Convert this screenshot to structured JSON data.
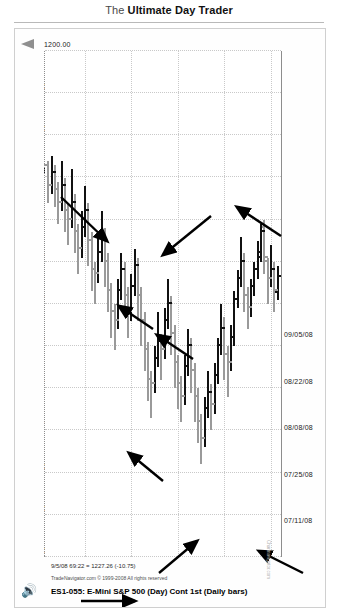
{
  "page": {
    "header_prefix": "The ",
    "header_bold": "Ultimate Day Trader"
  },
  "figure": {
    "chart_title": "ES1-055: E-Mini S&P 500 (Day) Cont 1st (Daily bars)",
    "copyright": "TradeNavigator.com © 1999-2008 All rights reserved",
    "quote_line": "9/5/08 69:22 = 1227.26 (-10.75)",
    "watermark_icon": "speaker-icon",
    "watermark_text": "Chartnavigator.com",
    "axis_arrow_icon": "up-arrow-icon",
    "highlight_color": "#1b1b1b",
    "bar_up_color": "#111111",
    "bar_down_color": "#9a9a9a"
  },
  "chart_data": {
    "type": "bar",
    "subtype": "ohlc-daily-bars-rotated",
    "title": "ES1-055: E-Mini S&P 500 (Day) Cont 1st (Daily bars)",
    "xlabel": "",
    "ylabel": "",
    "grid": true,
    "legend_position": "none",
    "ylim": [
      1200,
      1320
    ],
    "price_ticks": [
      "1320.00",
      "1310.00",
      "1300.00",
      "1290.00",
      "1280.00",
      "1270.00",
      "1260.00",
      "1250.00",
      "1240.00",
      "1230.00",
      "1220.00",
      "1210.00",
      "1200.00"
    ],
    "price_tick_highlighted": "1230.00",
    "date_ticks": [
      "09/05/08",
      "08/22/08",
      "08/08/08",
      "07/25/08",
      "07/11/08"
    ],
    "last_quote": {
      "date": "9/5/08",
      "price": 1227.26,
      "change": -10.75
    },
    "bars": [
      {
        "i": 0,
        "o": 1253.5,
        "h": 1259.0,
        "l": 1251.0,
        "c": 1257.5,
        "dir": "up"
      },
      {
        "i": 1,
        "o": 1257.0,
        "h": 1262.0,
        "l": 1250.0,
        "c": 1252.0,
        "dir": "down"
      },
      {
        "i": 2,
        "o": 1252.0,
        "h": 1256.0,
        "l": 1246.0,
        "c": 1254.0,
        "dir": "up"
      },
      {
        "i": 3,
        "o": 1254.0,
        "h": 1260.0,
        "l": 1249.0,
        "c": 1250.0,
        "dir": "down"
      },
      {
        "i": 4,
        "o": 1249.0,
        "h": 1253.0,
        "l": 1240.0,
        "c": 1242.0,
        "dir": "down"
      },
      {
        "i": 5,
        "o": 1243.0,
        "h": 1250.0,
        "l": 1241.0,
        "c": 1249.0,
        "dir": "up"
      },
      {
        "i": 6,
        "o": 1248.0,
        "h": 1254.0,
        "l": 1245.0,
        "c": 1252.0,
        "dir": "up"
      },
      {
        "i": 7,
        "o": 1252.0,
        "h": 1258.0,
        "l": 1250.0,
        "c": 1256.0,
        "dir": "up"
      },
      {
        "i": 8,
        "o": 1256.0,
        "h": 1263.0,
        "l": 1254.0,
        "c": 1261.0,
        "dir": "up"
      },
      {
        "i": 9,
        "o": 1261.0,
        "h": 1266.0,
        "l": 1256.0,
        "c": 1258.0,
        "dir": "down"
      },
      {
        "i": 10,
        "o": 1258.0,
        "h": 1262.0,
        "l": 1248.0,
        "c": 1250.0,
        "dir": "down"
      },
      {
        "i": 11,
        "o": 1250.0,
        "h": 1256.0,
        "l": 1244.0,
        "c": 1254.0,
        "dir": "up"
      },
      {
        "i": 12,
        "o": 1254.0,
        "h": 1261.0,
        "l": 1252.0,
        "c": 1259.0,
        "dir": "up"
      },
      {
        "i": 13,
        "o": 1259.0,
        "h": 1270.0,
        "l": 1257.0,
        "c": 1268.0,
        "dir": "up"
      },
      {
        "i": 14,
        "o": 1268.0,
        "h": 1276.0,
        "l": 1265.0,
        "c": 1274.0,
        "dir": "up"
      },
      {
        "i": 15,
        "o": 1274.0,
        "h": 1282.0,
        "l": 1270.0,
        "c": 1272.0,
        "dir": "down"
      },
      {
        "i": 16,
        "o": 1272.0,
        "h": 1278.0,
        "l": 1263.0,
        "c": 1266.0,
        "dir": "down"
      },
      {
        "i": 17,
        "o": 1266.0,
        "h": 1272.0,
        "l": 1260.0,
        "c": 1270.0,
        "dir": "up"
      },
      {
        "i": 18,
        "o": 1270.0,
        "h": 1279.0,
        "l": 1268.0,
        "c": 1277.0,
        "dir": "up"
      },
      {
        "i": 19,
        "o": 1277.0,
        "h": 1286.0,
        "l": 1274.0,
        "c": 1284.0,
        "dir": "up"
      },
      {
        "i": 20,
        "o": 1284.0,
        "h": 1290.0,
        "l": 1279.0,
        "c": 1281.0,
        "dir": "down"
      },
      {
        "i": 21,
        "o": 1281.0,
        "h": 1287.0,
        "l": 1276.0,
        "c": 1285.0,
        "dir": "up"
      },
      {
        "i": 22,
        "o": 1285.0,
        "h": 1294.0,
        "l": 1282.0,
        "c": 1292.0,
        "dir": "up"
      },
      {
        "i": 23,
        "o": 1292.0,
        "h": 1298.0,
        "l": 1286.0,
        "c": 1288.0,
        "dir": "down"
      },
      {
        "i": 24,
        "o": 1288.0,
        "h": 1293.0,
        "l": 1280.0,
        "c": 1282.0,
        "dir": "down"
      },
      {
        "i": 25,
        "o": 1282.0,
        "h": 1288.0,
        "l": 1274.0,
        "c": 1276.0,
        "dir": "down"
      },
      {
        "i": 26,
        "o": 1276.0,
        "h": 1281.0,
        "l": 1268.0,
        "c": 1270.0,
        "dir": "down"
      },
      {
        "i": 27,
        "o": 1270.0,
        "h": 1277.0,
        "l": 1266.0,
        "c": 1275.0,
        "dir": "up"
      },
      {
        "i": 28,
        "o": 1275.0,
        "h": 1284.0,
        "l": 1272.0,
        "c": 1282.0,
        "dir": "up"
      },
      {
        "i": 29,
        "o": 1282.0,
        "h": 1288.0,
        "l": 1277.0,
        "c": 1279.0,
        "dir": "down"
      },
      {
        "i": 30,
        "o": 1279.0,
        "h": 1285.0,
        "l": 1272.0,
        "c": 1274.0,
        "dir": "down"
      },
      {
        "i": 31,
        "o": 1274.0,
        "h": 1280.0,
        "l": 1265.0,
        "c": 1267.0,
        "dir": "down"
      },
      {
        "i": 32,
        "o": 1267.0,
        "h": 1272.0,
        "l": 1258.0,
        "c": 1260.0,
        "dir": "down"
      },
      {
        "i": 33,
        "o": 1260.0,
        "h": 1266.0,
        "l": 1254.0,
        "c": 1264.0,
        "dir": "up"
      },
      {
        "i": 34,
        "o": 1264.0,
        "h": 1273.0,
        "l": 1261.0,
        "c": 1271.0,
        "dir": "up"
      },
      {
        "i": 35,
        "o": 1271.0,
        "h": 1278.0,
        "l": 1267.0,
        "c": 1269.0,
        "dir": "down"
      },
      {
        "i": 36,
        "o": 1269.0,
        "h": 1275.0,
        "l": 1262.0,
        "c": 1273.0,
        "dir": "up"
      },
      {
        "i": 37,
        "o": 1273.0,
        "h": 1281.0,
        "l": 1270.0,
        "c": 1279.0,
        "dir": "up"
      },
      {
        "i": 38,
        "o": 1279.0,
        "h": 1287.0,
        "l": 1276.0,
        "c": 1278.0,
        "dir": "down"
      },
      {
        "i": 39,
        "o": 1278.0,
        "h": 1283.0,
        "l": 1269.0,
        "c": 1271.0,
        "dir": "down"
      },
      {
        "i": 40,
        "o": 1271.0,
        "h": 1276.0,
        "l": 1262.0,
        "c": 1264.0,
        "dir": "down"
      },
      {
        "i": 41,
        "o": 1264.0,
        "h": 1270.0,
        "l": 1256.0,
        "c": 1258.0,
        "dir": "down"
      },
      {
        "i": 42,
        "o": 1258.0,
        "h": 1264.0,
        "l": 1249.0,
        "c": 1251.0,
        "dir": "down"
      },
      {
        "i": 43,
        "o": 1251.0,
        "h": 1258.0,
        "l": 1247.0,
        "c": 1256.0,
        "dir": "up"
      },
      {
        "i": 44,
        "o": 1256.0,
        "h": 1264.0,
        "l": 1253.0,
        "c": 1262.0,
        "dir": "up"
      },
      {
        "i": 45,
        "o": 1262.0,
        "h": 1268.0,
        "l": 1256.0,
        "c": 1258.0,
        "dir": "down"
      },
      {
        "i": 46,
        "o": 1258.0,
        "h": 1263.0,
        "l": 1250.0,
        "c": 1252.0,
        "dir": "down"
      },
      {
        "i": 47,
        "o": 1252.0,
        "h": 1259.0,
        "l": 1248.0,
        "c": 1257.0,
        "dir": "up"
      },
      {
        "i": 48,
        "o": 1257.0,
        "h": 1266.0,
        "l": 1254.0,
        "c": 1264.0,
        "dir": "up"
      },
      {
        "i": 49,
        "o": 1264.0,
        "h": 1271.0,
        "l": 1260.0,
        "c": 1262.0,
        "dir": "down"
      },
      {
        "i": 50,
        "o": 1262.0,
        "h": 1268.0,
        "l": 1255.0,
        "c": 1257.0,
        "dir": "down"
      },
      {
        "i": 51,
        "o": 1257.0,
        "h": 1262.0,
        "l": 1248.0,
        "c": 1250.0,
        "dir": "down"
      },
      {
        "i": 52,
        "o": 1250.0,
        "h": 1256.0,
        "l": 1242.0,
        "c": 1244.0,
        "dir": "down"
      },
      {
        "i": 53,
        "o": 1244.0,
        "h": 1250.0,
        "l": 1238.0,
        "c": 1248.0,
        "dir": "up"
      },
      {
        "i": 54,
        "o": 1248.0,
        "h": 1255.0,
        "l": 1244.0,
        "c": 1253.0,
        "dir": "up"
      },
      {
        "i": 55,
        "o": 1253.0,
        "h": 1260.0,
        "l": 1250.0,
        "c": 1252.0,
        "dir": "down"
      },
      {
        "i": 56,
        "o": 1252.0,
        "h": 1257.0,
        "l": 1243.0,
        "c": 1245.0,
        "dir": "down"
      },
      {
        "i": 57,
        "o": 1245.0,
        "h": 1251.0,
        "l": 1236.0,
        "c": 1238.0,
        "dir": "down"
      },
      {
        "i": 58,
        "o": 1238.0,
        "h": 1244.0,
        "l": 1232.0,
        "c": 1242.0,
        "dir": "up"
      },
      {
        "i": 59,
        "o": 1242.0,
        "h": 1249.0,
        "l": 1238.0,
        "c": 1247.0,
        "dir": "up"
      },
      {
        "i": 60,
        "o": 1247.0,
        "h": 1253.0,
        "l": 1241.0,
        "c": 1243.0,
        "dir": "down"
      },
      {
        "i": 61,
        "o": 1243.0,
        "h": 1248.0,
        "l": 1234.0,
        "c": 1236.0,
        "dir": "down"
      },
      {
        "i": 62,
        "o": 1236.0,
        "h": 1242.0,
        "l": 1228.0,
        "c": 1240.0,
        "dir": "up"
      },
      {
        "i": 63,
        "o": 1240.0,
        "h": 1246.0,
        "l": 1236.0,
        "c": 1238.0,
        "dir": "down"
      },
      {
        "i": 64,
        "o": 1238.0,
        "h": 1243.0,
        "l": 1230.0,
        "c": 1232.0,
        "dir": "down"
      },
      {
        "i": 65,
        "o": 1232.0,
        "h": 1238.0,
        "l": 1226.0,
        "c": 1236.0,
        "dir": "up"
      },
      {
        "i": 66,
        "o": 1236.0,
        "h": 1241.0,
        "l": 1231.0,
        "c": 1233.0,
        "dir": "down"
      },
      {
        "i": 67,
        "o": 1233.0,
        "h": 1237.0,
        "l": 1227.0,
        "c": 1229.0,
        "dir": "down"
      },
      {
        "i": 68,
        "o": 1229.0,
        "h": 1234.0,
        "l": 1225.0,
        "c": 1232.0,
        "dir": "up"
      },
      {
        "i": 69,
        "o": 1232.0,
        "h": 1236.0,
        "l": 1226.0,
        "c": 1227.3,
        "dir": "down"
      }
    ],
    "annotations": [
      {
        "name": "arrow-1",
        "x1": 46,
        "y1": 168,
        "x2": 92,
        "y2": 212
      },
      {
        "name": "arrow-2",
        "x1": 196,
        "y1": 187,
        "x2": 148,
        "y2": 226
      },
      {
        "name": "arrow-3",
        "x1": 266,
        "y1": 207,
        "x2": 222,
        "y2": 178
      },
      {
        "name": "arrow-4",
        "x1": 138,
        "y1": 300,
        "x2": 104,
        "y2": 277
      },
      {
        "name": "arrow-5",
        "x1": 178,
        "y1": 330,
        "x2": 142,
        "y2": 306
      },
      {
        "name": "arrow-6",
        "x1": 148,
        "y1": 452,
        "x2": 114,
        "y2": 424
      },
      {
        "name": "arrow-7",
        "x1": 144,
        "y1": 544,
        "x2": 182,
        "y2": 512
      },
      {
        "name": "arrow-8",
        "x1": 288,
        "y1": 544,
        "x2": 244,
        "y2": 522
      },
      {
        "name": "arrow-9",
        "x1": 66,
        "y1": 572,
        "x2": 120,
        "y2": 572
      }
    ]
  }
}
